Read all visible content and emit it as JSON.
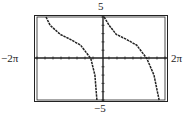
{
  "chart_data": {
    "type": "line",
    "title": "",
    "function_description": "cotangent-type curve, decreasing branches with vertical asymptotes, shifted up",
    "xlim": [
      "-2π",
      "2π"
    ],
    "ylim": [
      -5,
      5
    ],
    "xlim_numeric": [
      -6.2832,
      6.2832
    ],
    "ylim_numeric": [
      -5,
      5
    ],
    "x_tick_labels": {
      "left": "−2π",
      "right": "2π"
    },
    "y_tick_labels": {
      "top": "5",
      "bottom": "−5"
    },
    "x_tick_scale": "π/4",
    "y_tick_scale": 1,
    "grid": false,
    "asymptotes_x": [
      -6.0,
      -0.2,
      6.0
    ],
    "series": [
      {
        "name": "branch-1",
        "x": [
          -5.4,
          -5.0,
          -4.0,
          -3.0,
          -2.0,
          -1.0,
          -0.6,
          -0.4
        ],
        "y": [
          5.0,
          4.0,
          2.9,
          2.3,
          1.6,
          0.0,
          -2.0,
          -5.0
        ]
      },
      {
        "name": "branch-2",
        "x": [
          0.3,
          0.8,
          1.5,
          2.5,
          3.5,
          4.5,
          5.2,
          5.7
        ],
        "y": [
          5.0,
          4.0,
          2.9,
          2.3,
          1.6,
          0.0,
          -2.0,
          -5.0
        ]
      }
    ]
  },
  "labels": {
    "ymax": "5",
    "ymin": "−5",
    "xmin": "−2π",
    "xmax": "2π"
  }
}
